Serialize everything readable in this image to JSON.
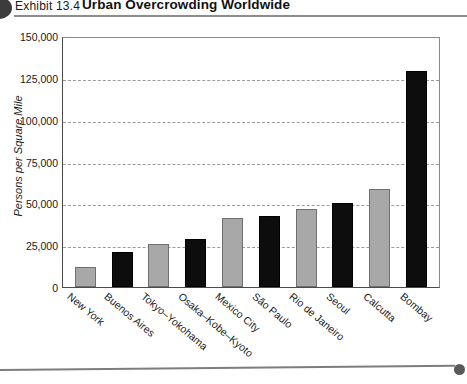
{
  "header": {
    "exhibit_label": "Exhibit 13.4",
    "title": "Urban Overcrowding Worldwide"
  },
  "chart_data": {
    "type": "bar",
    "title": "Urban Overcrowding Worldwide",
    "xlabel": "",
    "ylabel": "Persons per Square Mile",
    "ylim": [
      0,
      150000
    ],
    "ytick_labels": [
      "150,000",
      "125,000",
      "100,000",
      "75,000",
      "50,000",
      "25,000",
      "0"
    ],
    "ytick_values": [
      150000,
      125000,
      100000,
      75000,
      50000,
      25000,
      0
    ],
    "grid": true,
    "legend": "none",
    "categories": [
      "New York",
      "Buenos Aires",
      "Tokyo–Yokohama",
      "Osaka–Kobe–Kyoto",
      "Mexico City",
      "São Paulo",
      "Rio de Janeiro",
      "Seoul",
      "Calcutta",
      "Bombay"
    ],
    "values": [
      12000,
      21000,
      25500,
      28500,
      41000,
      42500,
      46500,
      50500,
      58500,
      129000
    ],
    "bar_colors": [
      "#a8a8a8",
      "#0d0d0d",
      "#a8a8a8",
      "#0d0d0d",
      "#a8a8a8",
      "#0d0d0d",
      "#a8a8a8",
      "#0d0d0d",
      "#a8a8a8",
      "#0d0d0d"
    ]
  }
}
